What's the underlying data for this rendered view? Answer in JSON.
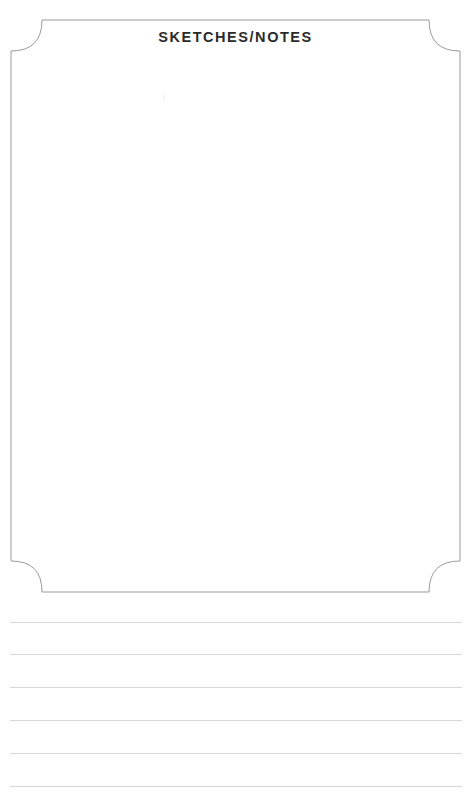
{
  "page": {
    "width": 471,
    "height": 793,
    "background_color": "#ffffff",
    "kind": "printable-worksheet-page"
  },
  "frame": {
    "name": "sketches-notes-panel",
    "border_color": "#9a9a9a",
    "border_width_px": 1,
    "corner_style": "concave",
    "corner_radius_px": 31,
    "left_px": 11,
    "top_px": 20,
    "right_px": 460,
    "bottom_px": 592
  },
  "header": {
    "title": "SKETCHES/NOTES",
    "title_color": "#2b2b2b",
    "align": "center"
  },
  "sketch_area": {
    "label": "blank sketch area",
    "content": "",
    "placeholder": ""
  },
  "ruled_lines": {
    "count": 6,
    "color": "#d8d8d8",
    "left_px": 10,
    "right_px": 462,
    "y_positions": [
      622,
      654,
      687,
      720,
      753,
      786
    ]
  }
}
